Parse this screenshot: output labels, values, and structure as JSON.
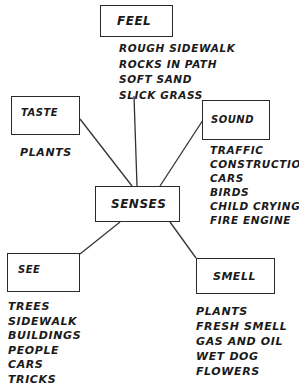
{
  "diagram": {
    "type": "mind-map",
    "center": {
      "label": "SENSES"
    },
    "nodes": [
      {
        "id": "feel",
        "label": "FEEL",
        "items": [
          "ROUGH SIDEWALK",
          "ROCKS IN PATH",
          "SOFT SAND",
          "SLICK GRASS"
        ]
      },
      {
        "id": "taste",
        "label": "TASTE",
        "items": [
          "PLANTS"
        ]
      },
      {
        "id": "sound",
        "label": "SOUND",
        "items": [
          "TRAFFIC",
          "CONSTRUCTION",
          "CARS",
          "BIRDS",
          "CHILD CRYING",
          "FIRE ENGINE"
        ]
      },
      {
        "id": "see",
        "label": "SEE",
        "items": [
          "TREES",
          "SIDEWALK",
          "BUILDINGS",
          "PEOPLE",
          "CARS",
          "TRICKS"
        ]
      },
      {
        "id": "smell",
        "label": "SMELL",
        "items": [
          "PLANTS",
          "FRESH SMELL",
          "GAS AND OIL",
          "WET DOG",
          "FLOWERS"
        ]
      }
    ],
    "edges": [
      {
        "from": "senses",
        "to": "feel"
      },
      {
        "from": "senses",
        "to": "taste"
      },
      {
        "from": "senses",
        "to": "sound"
      },
      {
        "from": "senses",
        "to": "see"
      },
      {
        "from": "senses",
        "to": "smell"
      }
    ],
    "colors": {
      "ink": "#1a1a1a",
      "background": "#ffffff"
    }
  }
}
